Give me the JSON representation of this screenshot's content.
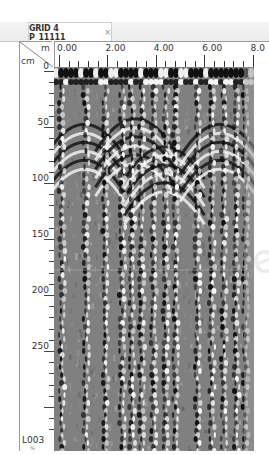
{
  "tab": {
    "label": "GRID 4 P_11111",
    "close_icon": "×"
  },
  "axes": {
    "corner_x_unit": "m",
    "corner_y_unit": "cm",
    "x_labels": [
      {
        "value": "0.00",
        "pos": 0
      },
      {
        "value": "2.00",
        "pos": 2
      },
      {
        "value": "4.00",
        "pos": 4
      },
      {
        "value": "6.00",
        "pos": 6
      },
      {
        "value": "8.0",
        "pos": 8
      }
    ],
    "x_range_m": [
      0,
      8.1
    ],
    "x_minor_step_m": 0.4,
    "y_labels": [
      {
        "value": "0",
        "pos": 0
      },
      {
        "value": "50",
        "pos": 50
      },
      {
        "value": "100",
        "pos": 100
      },
      {
        "value": "150",
        "pos": 150
      },
      {
        "value": "200",
        "pos": 200
      },
      {
        "value": "250",
        "pos": 250
      }
    ],
    "y_range_cm": [
      0,
      330
    ],
    "y_minor_step_cm": 10
  },
  "line_label": "L003",
  "line_sublabel": "%",
  "radargram": {
    "background": "#808080",
    "strong_columns_m": [
      0.1,
      1.1,
      1.9,
      2.6,
      3.0,
      3.4,
      3.9,
      4.4,
      4.8,
      5.7,
      6.3,
      6.8,
      7.3,
      7.7
    ],
    "hyperbola_apexes": [
      {
        "x_m": 1.1,
        "y_cm": 40
      },
      {
        "x_m": 3.2,
        "y_cm": 35
      },
      {
        "x_m": 4.4,
        "y_cm": 60
      },
      {
        "x_m": 6.7,
        "y_cm": 40
      }
    ]
  },
  "watermark": "e"
}
